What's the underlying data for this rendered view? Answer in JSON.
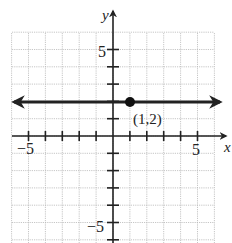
{
  "chart_data": {
    "type": "line",
    "title": "",
    "xlabel": "x",
    "ylabel": "y",
    "xlim": [
      -6,
      6
    ],
    "ylim": [
      -6,
      6
    ],
    "grid": true,
    "x_tick_labels": [
      {
        "value": -5,
        "label": "−5"
      },
      {
        "value": 5,
        "label": "5"
      }
    ],
    "y_tick_labels": [
      {
        "value": 5,
        "label": "5"
      },
      {
        "value": -5,
        "label": "−5"
      }
    ],
    "series": [
      {
        "name": "horizontal line",
        "equation": "y = 2",
        "x": [
          -6,
          6
        ],
        "y": [
          2,
          2
        ],
        "arrows": "both"
      }
    ],
    "points": [
      {
        "x": 1,
        "y": 2,
        "label": "(1,2)",
        "filled": true
      }
    ]
  },
  "labels": {
    "x_axis": "x",
    "y_axis": "y",
    "x_neg5": "−5",
    "x_pos5": "5",
    "y_pos5": "5",
    "y_neg5": "−5",
    "point": "(1,2)"
  }
}
